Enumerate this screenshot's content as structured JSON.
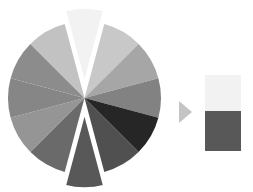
{
  "wheel": {
    "center": [
      84.5,
      98
    ],
    "radius": 76.5,
    "explode_offset": 14,
    "gap_color": "#ffffff",
    "slices": [
      {
        "name": "slice-0",
        "color": "#f2f2f2",
        "exploded": true
      },
      {
        "name": "slice-1",
        "color": "#c8c8c8",
        "exploded": false
      },
      {
        "name": "slice-2",
        "color": "#a6a6a6",
        "exploded": false
      },
      {
        "name": "slice-3",
        "color": "#828282",
        "exploded": false
      },
      {
        "name": "slice-4",
        "color": "#262626",
        "exploded": false
      },
      {
        "name": "slice-5",
        "color": "#505050",
        "exploded": false
      },
      {
        "name": "slice-6",
        "color": "#585858",
        "exploded": true
      },
      {
        "name": "slice-7",
        "color": "#6a6a6a",
        "exploded": false
      },
      {
        "name": "slice-8",
        "color": "#959595",
        "exploded": false
      },
      {
        "name": "slice-9",
        "color": "#868686",
        "exploded": false
      },
      {
        "name": "slice-10",
        "color": "#8c8c8c",
        "exploded": false
      },
      {
        "name": "slice-11",
        "color": "#c2c2c2",
        "exploded": false
      }
    ]
  },
  "arrow": {
    "icon": "triangle-right-icon",
    "color": "#c4c4c4"
  },
  "swatches": [
    {
      "name": "light-swatch",
      "color": "#f2f2f2"
    },
    {
      "name": "dark-swatch",
      "color": "#585858"
    }
  ]
}
